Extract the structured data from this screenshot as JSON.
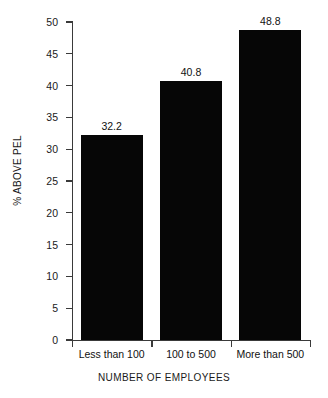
{
  "chart_data": {
    "type": "bar",
    "title": "",
    "subtitle": "",
    "categories": [
      "Less than 100",
      "100 to 500",
      "More than 500"
    ],
    "values": [
      32.2,
      40.8,
      48.8
    ],
    "value_labels": [
      "32.2",
      "40.8",
      "48.8"
    ],
    "xlabel": "NUMBER OF EMPLOYEES",
    "ylabel": "% ABOVE PEL",
    "ylim": [
      0,
      50
    ],
    "ytick_step": 5,
    "yticks": [
      0,
      5,
      10,
      15,
      20,
      25,
      30,
      35,
      40,
      45,
      50
    ],
    "ytick_labels": [
      "0",
      "5",
      "10",
      "15",
      "20",
      "25",
      "30",
      "35",
      "40",
      "45",
      "50"
    ],
    "grid": false,
    "legend": null,
    "bar_color": "#060606",
    "axis_color": "#3a3a3a",
    "background": "#ffffff"
  }
}
